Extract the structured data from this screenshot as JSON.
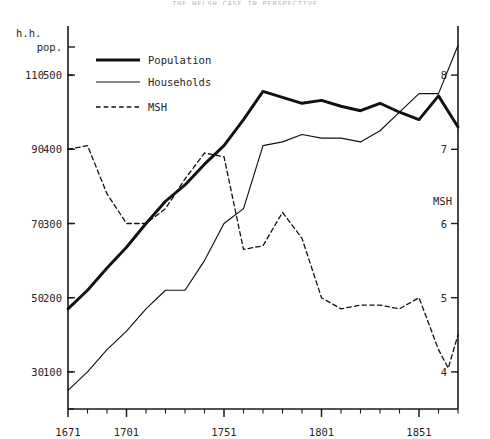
{
  "title": "THE WELSH CASE IN PERSPECTIVE",
  "axes": {
    "left_hh_header": "h.h.",
    "left_pop_header": "pop.",
    "right_header": "MSH",
    "hh_ticks": [
      30,
      50,
      70,
      90,
      110
    ],
    "pop_ticks": [
      100,
      200,
      300,
      400,
      500
    ],
    "msh_ticks": [
      4,
      5,
      6,
      7,
      8
    ],
    "x_major_ticks": [
      1671,
      1701,
      1751,
      1801,
      1851
    ],
    "x_minor_step": 10,
    "x_range": [
      1671,
      1871
    ],
    "hh_range": [
      20,
      120
    ],
    "pop_range": [
      50,
      550
    ],
    "msh_range": [
      3.5,
      8.5
    ],
    "grid": false
  },
  "legend": {
    "position": "top-left",
    "items": [
      {
        "label": "Population",
        "style": "thick-solid"
      },
      {
        "label": "Households",
        "style": "thin-solid"
      },
      {
        "label": "MSH",
        "style": "dashed"
      }
    ]
  },
  "chart_data": {
    "type": "line",
    "title": "THE WELSH CASE IN PERSPECTIVE",
    "xlabel": "",
    "ylabel": "h.h. / pop.",
    "y2label": "MSH",
    "xlim": [
      1671,
      1871
    ],
    "ylim": [
      50,
      550
    ],
    "y2lim": [
      3.5,
      8.5
    ],
    "grid": false,
    "x": [
      1671,
      1681,
      1691,
      1701,
      1711,
      1721,
      1731,
      1741,
      1751,
      1761,
      1771,
      1781,
      1791,
      1801,
      1811,
      1821,
      1831,
      1841,
      1851,
      1861,
      1871
    ],
    "series": [
      {
        "name": "Population",
        "axis": "pop",
        "style": "thick-solid",
        "values": [
          185,
          210,
          240,
          268,
          300,
          330,
          352,
          380,
          405,
          440,
          478,
          470,
          462,
          466,
          458,
          452,
          462,
          450,
          440,
          472,
          430
        ]
      },
      {
        "name": "Households",
        "axis": "hh",
        "style": "thin-solid",
        "values": [
          25,
          30,
          36,
          41,
          47,
          52,
          52,
          60,
          70,
          74,
          91,
          92,
          94,
          93,
          93,
          92,
          95,
          100,
          105,
          105,
          118
        ]
      },
      {
        "name": "MSH",
        "axis": "msh",
        "style": "dashed",
        "values": [
          7.0,
          7.05,
          6.4,
          6.0,
          6.0,
          6.2,
          6.6,
          6.95,
          6.9,
          5.65,
          5.7,
          6.15,
          5.8,
          5.0,
          4.85,
          4.9,
          4.9,
          4.85,
          5.0,
          4.55,
          4.35
        ]
      }
    ],
    "msh_tail": {
      "x": [
        1861,
        1866,
        1871
      ],
      "values": [
        4.3,
        4.05,
        4.5
      ]
    }
  }
}
